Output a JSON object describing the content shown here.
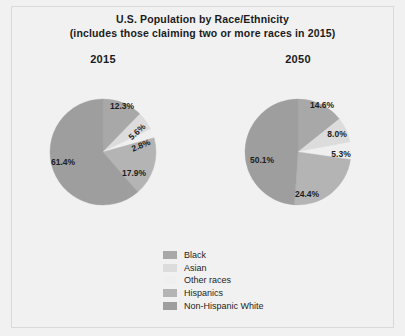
{
  "figure": {
    "title_line1": "U.S. Population by Race/Ethnicity",
    "title_line2": "(includes those claiming two or more races in 2015)",
    "background_color": "#f1f1f1",
    "frame_color": "#d9d9d9",
    "label_color": "#1d1d1d"
  },
  "legend": {
    "position": "bottom-center",
    "items": [
      {
        "label": "Black",
        "color": "#a8a8a8"
      },
      {
        "label": "Asian",
        "color": "#dcdcdc"
      },
      {
        "label": "Other races",
        "color": "#efefef"
      },
      {
        "label": "Hispanics",
        "color": "#b4b4b4"
      },
      {
        "label": "Non-Hispanic White",
        "color": "#9e9e9e"
      }
    ]
  },
  "chart_data": [
    {
      "type": "pie",
      "title": "2015",
      "categories": [
        "Black",
        "Asian",
        "Other races",
        "Hispanics",
        "Non-Hispanic White"
      ],
      "values": [
        12.3,
        5.6,
        2.8,
        17.9,
        61.4
      ],
      "labels": [
        "12.3%",
        "5.6%",
        "2.8%",
        "17.9%",
        "61.4%"
      ],
      "colors": [
        "#a8a8a8",
        "#dcdcdc",
        "#efefef",
        "#b4b4b4",
        "#9e9e9e"
      ],
      "center": [
        103,
        152
      ],
      "radius": 53,
      "start_angle": 0,
      "direction": "clockwise",
      "label_positions": [
        [
          122,
          109
        ],
        [
          139,
          134
        ],
        [
          142,
          148
        ],
        [
          134,
          176
        ],
        [
          63,
          165
        ]
      ],
      "label_rotations": [
        0,
        -42,
        -22,
        0,
        0
      ]
    },
    {
      "type": "pie",
      "title": "2050",
      "categories": [
        "Black",
        "Asian",
        "Other races",
        "Hispanics",
        "Non-Hispanic White"
      ],
      "values": [
        14.6,
        8.0,
        5.3,
        24.4,
        50.1
      ],
      "labels": [
        "14.6%",
        "8.0%",
        "5.3%",
        "24.4%",
        "50.1%"
      ],
      "colors": [
        "#a8a8a8",
        "#dcdcdc",
        "#efefef",
        "#b4b4b4",
        "#9e9e9e"
      ],
      "center": [
        298,
        152
      ],
      "radius": 53,
      "start_angle": 0,
      "direction": "clockwise",
      "label_positions": [
        [
          322,
          108
        ],
        [
          337,
          137
        ],
        [
          341,
          157
        ],
        [
          307,
          197
        ],
        [
          262,
          163
        ]
      ],
      "label_rotations": [
        0,
        0,
        0,
        0,
        0
      ]
    }
  ]
}
